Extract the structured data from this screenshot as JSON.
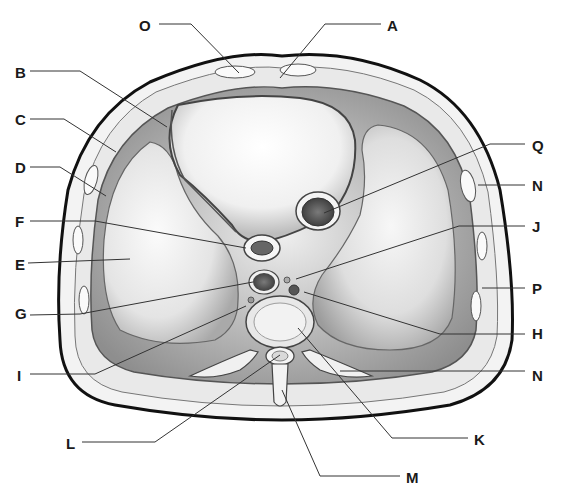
{
  "figure": {
    "labels": [
      {
        "id": "O",
        "text": "O",
        "x": 139,
        "y": 18
      },
      {
        "id": "A",
        "text": "A",
        "x": 387,
        "y": 18
      },
      {
        "id": "B",
        "text": "B",
        "x": 15,
        "y": 65
      },
      {
        "id": "C",
        "text": "C",
        "x": 15,
        "y": 112
      },
      {
        "id": "D",
        "text": "D",
        "x": 15,
        "y": 160
      },
      {
        "id": "F",
        "text": "F",
        "x": 15,
        "y": 214
      },
      {
        "id": "E",
        "text": "E",
        "x": 15,
        "y": 257
      },
      {
        "id": "G",
        "text": "G",
        "x": 15,
        "y": 306
      },
      {
        "id": "I",
        "text": "I",
        "x": 15,
        "y": 368
      },
      {
        "id": "L",
        "text": "L",
        "x": 66,
        "y": 436
      },
      {
        "id": "Q",
        "text": "Q",
        "x": 532,
        "y": 138
      },
      {
        "id": "N1",
        "text": "N",
        "x": 532,
        "y": 178
      },
      {
        "id": "J",
        "text": "J",
        "x": 532,
        "y": 219
      },
      {
        "id": "P",
        "text": "P",
        "x": 532,
        "y": 281
      },
      {
        "id": "H",
        "text": "H",
        "x": 532,
        "y": 326
      },
      {
        "id": "N2",
        "text": "N",
        "x": 532,
        "y": 368
      },
      {
        "id": "K",
        "text": "K",
        "x": 474,
        "y": 432
      },
      {
        "id": "M",
        "text": "M",
        "x": 406,
        "y": 470
      }
    ],
    "leaders": [
      {
        "id": "O",
        "points": [
          [
            159,
            24
          ],
          [
            191,
            24
          ],
          [
            239,
            73
          ]
        ]
      },
      {
        "id": "A",
        "points": [
          [
            381,
            24
          ],
          [
            325,
            24
          ],
          [
            280,
            78
          ]
        ]
      },
      {
        "id": "B",
        "points": [
          [
            30,
            71
          ],
          [
            80,
            71
          ],
          [
            167,
            127
          ]
        ]
      },
      {
        "id": "C",
        "points": [
          [
            30,
            119
          ],
          [
            64,
            119
          ],
          [
            116,
            152
          ]
        ]
      },
      {
        "id": "D",
        "points": [
          [
            30,
            167
          ],
          [
            60,
            167
          ],
          [
            106,
            196
          ]
        ]
      },
      {
        "id": "F",
        "points": [
          [
            30,
            221
          ],
          [
            95,
            221
          ],
          [
            246,
            248
          ]
        ]
      },
      {
        "id": "E",
        "points": [
          [
            28,
            263
          ],
          [
            130,
            259
          ]
        ]
      },
      {
        "id": "G",
        "points": [
          [
            30,
            315
          ],
          [
            80,
            314
          ],
          [
            253,
            282
          ]
        ]
      },
      {
        "id": "I",
        "points": [
          [
            30,
            374
          ],
          [
            95,
            374
          ],
          [
            246,
            306
          ]
        ]
      },
      {
        "id": "L",
        "points": [
          [
            82,
            442
          ],
          [
            155,
            442
          ],
          [
            280,
            355
          ]
        ]
      },
      {
        "id": "Q",
        "points": [
          [
            525,
            144
          ],
          [
            490,
            144
          ],
          [
            324,
            213
          ]
        ]
      },
      {
        "id": "N1",
        "points": [
          [
            525,
            185
          ],
          [
            478,
            185
          ]
        ]
      },
      {
        "id": "J",
        "points": [
          [
            525,
            226
          ],
          [
            459,
            226
          ],
          [
            296,
            279
          ]
        ]
      },
      {
        "id": "P",
        "points": [
          [
            525,
            288
          ],
          [
            482,
            288
          ]
        ]
      },
      {
        "id": "H",
        "points": [
          [
            525,
            334
          ],
          [
            440,
            334
          ],
          [
            304,
            292
          ]
        ]
      },
      {
        "id": "N2",
        "points": [
          [
            525,
            371
          ],
          [
            340,
            371
          ]
        ]
      },
      {
        "id": "K",
        "points": [
          [
            468,
            438
          ],
          [
            392,
            438
          ],
          [
            298,
            328
          ]
        ]
      },
      {
        "id": "M",
        "points": [
          [
            400,
            476
          ],
          [
            320,
            476
          ],
          [
            282,
            390
          ]
        ]
      }
    ]
  }
}
